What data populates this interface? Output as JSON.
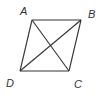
{
  "diagram": {
    "type": "quadrilateral-with-diagonals",
    "stroke_color": "#333333",
    "background": "#ffffff",
    "vertices": {
      "A": {
        "label": "A",
        "x": 32,
        "y": 20,
        "label_x": 20,
        "label_y": 15
      },
      "B": {
        "label": "B",
        "x": 81,
        "y": 20,
        "label_x": 88,
        "label_y": 18
      },
      "C": {
        "label": "C",
        "x": 69,
        "y": 71,
        "label_x": 74,
        "label_y": 88
      },
      "D": {
        "label": "D",
        "x": 20,
        "y": 71,
        "label_x": 6,
        "label_y": 87
      }
    },
    "edges": [
      [
        "A",
        "B"
      ],
      [
        "B",
        "C"
      ],
      [
        "C",
        "D"
      ],
      [
        "D",
        "A"
      ]
    ],
    "diagonals": [
      [
        "A",
        "C"
      ],
      [
        "B",
        "D"
      ]
    ]
  }
}
